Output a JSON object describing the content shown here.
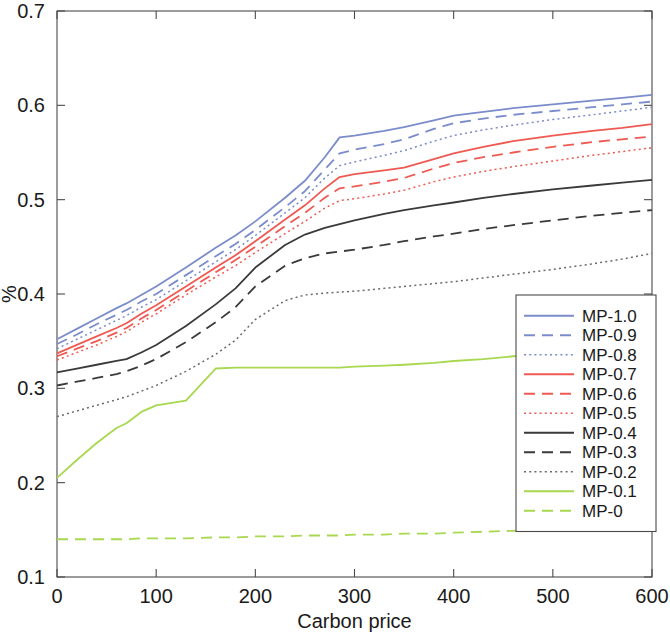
{
  "chart_data": {
    "type": "line",
    "title": "",
    "xlabel": "Carbon price",
    "ylabel": "%",
    "xlim": [
      0,
      600
    ],
    "ylim": [
      0.1,
      0.7
    ],
    "xticks": [
      0,
      100,
      200,
      300,
      400,
      500,
      600
    ],
    "xticklabels": [
      "0",
      "100",
      "200",
      "300",
      "400",
      "500",
      "600"
    ],
    "yticks": [
      0.1,
      0.2,
      0.3,
      0.4,
      0.5,
      0.6,
      0.7
    ],
    "yticklabels": [
      "0.1",
      "0.2",
      "0.3",
      "0.4",
      "0.5",
      "0.6",
      "0.7"
    ],
    "grid": false,
    "legend_position": "center right",
    "x": [
      0,
      20,
      40,
      60,
      70,
      85,
      100,
      130,
      160,
      180,
      200,
      230,
      250,
      270,
      285,
      300,
      330,
      350,
      380,
      400,
      430,
      460,
      500,
      540,
      570,
      600
    ],
    "series": [
      {
        "name": "MP-1.0",
        "color": "#7b8ccb",
        "style": "solid",
        "values": [
          0.352,
          0.363,
          0.374,
          0.385,
          0.39,
          0.399,
          0.408,
          0.428,
          0.449,
          0.462,
          0.477,
          0.502,
          0.52,
          0.545,
          0.566,
          0.568,
          0.573,
          0.577,
          0.584,
          0.589,
          0.593,
          0.597,
          0.601,
          0.605,
          0.608,
          0.611
        ]
      },
      {
        "name": "MP-0.9",
        "color": "#7b8ccb",
        "style": "dashed",
        "values": [
          0.347,
          0.357,
          0.368,
          0.378,
          0.383,
          0.392,
          0.4,
          0.42,
          0.44,
          0.453,
          0.468,
          0.492,
          0.509,
          0.532,
          0.549,
          0.553,
          0.559,
          0.564,
          0.575,
          0.581,
          0.586,
          0.59,
          0.594,
          0.598,
          0.601,
          0.604
        ]
      },
      {
        "name": "MP-0.8",
        "color": "#7b8ccb",
        "style": "dotted",
        "values": [
          0.342,
          0.352,
          0.362,
          0.372,
          0.377,
          0.386,
          0.394,
          0.414,
          0.434,
          0.447,
          0.462,
          0.486,
          0.502,
          0.523,
          0.536,
          0.54,
          0.547,
          0.552,
          0.562,
          0.568,
          0.574,
          0.579,
          0.585,
          0.59,
          0.594,
          0.598
        ]
      },
      {
        "name": "MP-0.7",
        "color": "#ee5a52",
        "style": "solid",
        "values": [
          0.337,
          0.346,
          0.355,
          0.364,
          0.369,
          0.379,
          0.388,
          0.408,
          0.428,
          0.441,
          0.456,
          0.479,
          0.494,
          0.512,
          0.524,
          0.527,
          0.531,
          0.534,
          0.543,
          0.549,
          0.556,
          0.562,
          0.568,
          0.573,
          0.576,
          0.58
        ]
      },
      {
        "name": "MP-0.6",
        "color": "#ee5a52",
        "style": "dashed",
        "values": [
          0.334,
          0.342,
          0.35,
          0.359,
          0.364,
          0.374,
          0.383,
          0.403,
          0.423,
          0.436,
          0.45,
          0.472,
          0.486,
          0.502,
          0.512,
          0.514,
          0.519,
          0.523,
          0.533,
          0.539,
          0.545,
          0.55,
          0.556,
          0.561,
          0.564,
          0.567
        ]
      },
      {
        "name": "MP-0.5",
        "color": "#ee5a52",
        "style": "dotted",
        "values": [
          0.33,
          0.338,
          0.346,
          0.355,
          0.36,
          0.37,
          0.379,
          0.399,
          0.418,
          0.43,
          0.444,
          0.464,
          0.477,
          0.491,
          0.499,
          0.501,
          0.506,
          0.51,
          0.519,
          0.524,
          0.53,
          0.535,
          0.541,
          0.547,
          0.551,
          0.555
        ]
      },
      {
        "name": "MP-0.4",
        "color": "#3a3a3a",
        "style": "solid",
        "values": [
          0.317,
          0.321,
          0.325,
          0.329,
          0.331,
          0.338,
          0.346,
          0.366,
          0.389,
          0.406,
          0.428,
          0.452,
          0.463,
          0.47,
          0.474,
          0.478,
          0.485,
          0.489,
          0.494,
          0.497,
          0.502,
          0.506,
          0.511,
          0.515,
          0.518,
          0.521
        ]
      },
      {
        "name": "MP-0.3",
        "color": "#3a3a3a",
        "style": "dashed",
        "values": [
          0.303,
          0.307,
          0.311,
          0.315,
          0.318,
          0.324,
          0.331,
          0.349,
          0.37,
          0.386,
          0.408,
          0.43,
          0.438,
          0.443,
          0.445,
          0.447,
          0.452,
          0.456,
          0.461,
          0.464,
          0.469,
          0.473,
          0.478,
          0.483,
          0.486,
          0.489
        ]
      },
      {
        "name": "MP-0.2",
        "color": "#6a6a6a",
        "style": "dotted",
        "values": [
          0.27,
          0.276,
          0.282,
          0.288,
          0.291,
          0.297,
          0.303,
          0.318,
          0.336,
          0.351,
          0.373,
          0.393,
          0.399,
          0.401,
          0.402,
          0.403,
          0.406,
          0.408,
          0.411,
          0.413,
          0.417,
          0.421,
          0.426,
          0.432,
          0.437,
          0.443
        ]
      },
      {
        "name": "MP-0.1",
        "color": "#a8d84f",
        "style": "solid",
        "values": [
          0.205,
          0.224,
          0.242,
          0.258,
          0.263,
          0.275,
          0.282,
          0.287,
          0.321,
          0.322,
          0.322,
          0.322,
          0.322,
          0.322,
          0.322,
          0.323,
          0.324,
          0.325,
          0.327,
          0.329,
          0.331,
          0.334,
          0.338,
          0.342,
          0.345,
          0.348
        ]
      },
      {
        "name": "MP-0",
        "color": "#a8d84f",
        "style": "dashed",
        "values": [
          0.14,
          0.14,
          0.14,
          0.14,
          0.14,
          0.141,
          0.141,
          0.141,
          0.142,
          0.142,
          0.143,
          0.143,
          0.144,
          0.144,
          0.144,
          0.145,
          0.145,
          0.146,
          0.146,
          0.147,
          0.148,
          0.149,
          0.15,
          0.151,
          0.152,
          0.153
        ]
      }
    ]
  },
  "legend": {
    "items": [
      {
        "label": "MP-1.0"
      },
      {
        "label": "MP-0.9"
      },
      {
        "label": "MP-0.8"
      },
      {
        "label": "MP-0.7"
      },
      {
        "label": "MP-0.6"
      },
      {
        "label": "MP-0.5"
      },
      {
        "label": "MP-0.4"
      },
      {
        "label": "MP-0.3"
      },
      {
        "label": "MP-0.2"
      },
      {
        "label": "MP-0.1"
      },
      {
        "label": "MP-0"
      }
    ]
  }
}
